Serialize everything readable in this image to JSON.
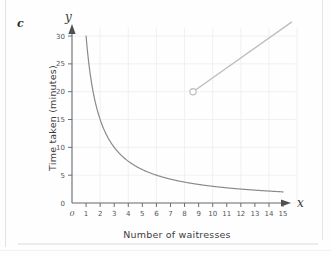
{
  "figure": {
    "part_label": "c",
    "x_axis_symbol": "x",
    "y_axis_symbol": "y"
  },
  "chart_data": {
    "type": "line",
    "title": "",
    "xlabel": "Number of waitresses",
    "ylabel": "Time taken (minutes)",
    "xlim": [
      0,
      15.6
    ],
    "ylim": [
      0,
      31
    ],
    "grid": true,
    "grid_color": "#e8edf2",
    "legend": "none",
    "x_ticks": [
      0,
      1,
      2,
      3,
      4,
      5,
      6,
      7,
      8,
      9,
      10,
      11,
      12,
      13,
      14,
      15
    ],
    "x_tick_labels": [
      "0",
      "1",
      "2",
      "3",
      "4",
      "5",
      "6",
      "7",
      "8",
      "9",
      "10",
      "11",
      "12",
      "13",
      "14",
      "15"
    ],
    "y_ticks": [
      0,
      5,
      10,
      15,
      20,
      25,
      30
    ],
    "y_tick_labels": [
      "0",
      "5",
      "10",
      "15",
      "20",
      "25",
      "30"
    ],
    "series": [
      {
        "name": "inverse-proportion-curve",
        "type": "curve",
        "relation": "y = 30 / x",
        "color": "#8a8a8a",
        "x_start": 1,
        "x_end": 15,
        "points": [
          [
            1,
            30
          ],
          [
            1.2,
            25
          ],
          [
            1.5,
            20
          ],
          [
            2,
            15
          ],
          [
            2.5,
            12
          ],
          [
            3,
            10
          ],
          [
            3.5,
            8.6
          ],
          [
            4,
            7.5
          ],
          [
            5,
            6
          ],
          [
            6,
            5
          ],
          [
            7,
            4.3
          ],
          [
            8,
            3.75
          ],
          [
            9,
            3.3
          ],
          [
            10,
            3
          ],
          [
            11,
            2.7
          ],
          [
            12,
            2.5
          ],
          [
            13,
            2.3
          ],
          [
            14,
            2.1
          ],
          [
            15,
            2
          ]
        ]
      },
      {
        "name": "straight-line-segment",
        "type": "line",
        "color": "#bfbfbf",
        "marker": "open-circle",
        "marker_point": [
          8.6,
          20
        ],
        "points": [
          [
            8.6,
            20
          ],
          [
            15.6,
            32.5
          ]
        ]
      }
    ]
  }
}
